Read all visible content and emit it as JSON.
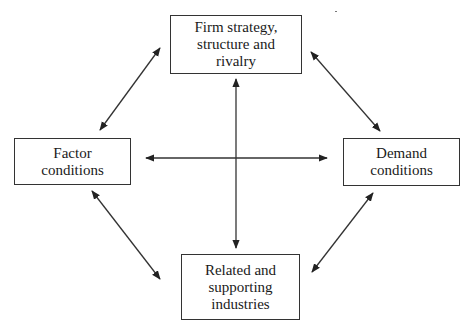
{
  "diagram": {
    "title": "",
    "nodes": [
      {
        "id": "firm",
        "label": "Firm strategy,\nstructure and\nrivalry",
        "x": 170,
        "y": 15,
        "w": 132,
        "h": 59
      },
      {
        "id": "factor",
        "label": "Factor\nconditions",
        "x": 14,
        "y": 138,
        "w": 117,
        "h": 47
      },
      {
        "id": "demand",
        "label": "Demand\nconditions",
        "x": 343,
        "y": 138,
        "w": 117,
        "h": 48
      },
      {
        "id": "related",
        "label": "Related and\nsupporting\nindustries",
        "x": 181,
        "y": 254,
        "w": 119,
        "h": 66
      }
    ],
    "edges": [
      {
        "from": "factor",
        "to": "firm",
        "type": "bidirectional"
      },
      {
        "from": "firm",
        "to": "demand",
        "type": "bidirectional"
      },
      {
        "from": "factor",
        "to": "related",
        "type": "bidirectional"
      },
      {
        "from": "related",
        "to": "demand",
        "type": "bidirectional"
      },
      {
        "from": "factor",
        "to": "demand",
        "type": "bidirectional"
      },
      {
        "from": "firm",
        "to": "related",
        "type": "bidirectional"
      }
    ]
  }
}
